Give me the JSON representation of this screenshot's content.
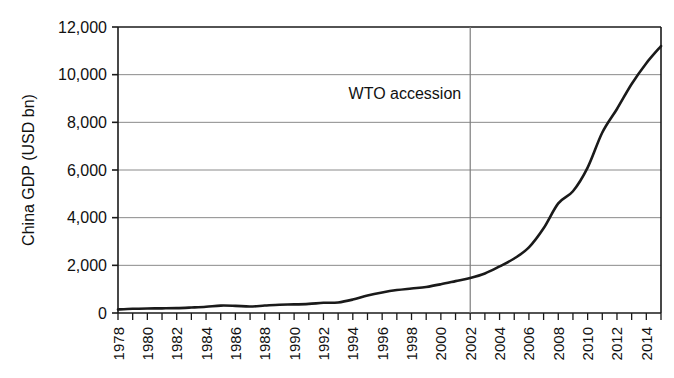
{
  "chart_data": {
    "type": "line",
    "title": "",
    "xlabel": "",
    "ylabel": "China GDP (USD bn)",
    "ylim": [
      0,
      12000
    ],
    "xlim": [
      1978,
      2015
    ],
    "ytick_labels": [
      "0",
      "2,000",
      "4,000",
      "6,000",
      "8,000",
      "10,000",
      "12,000"
    ],
    "ytick_values": [
      0,
      2000,
      4000,
      6000,
      8000,
      10000,
      12000
    ],
    "xtick_labels": [
      "1978",
      "1980",
      "1982",
      "1984",
      "1986",
      "1988",
      "1990",
      "1992",
      "1994",
      "1996",
      "1998",
      "2000",
      "2002",
      "2004",
      "2006",
      "2008",
      "2010",
      "2012",
      "2014"
    ],
    "xtick_values": [
      1978,
      1980,
      1982,
      1984,
      1986,
      1988,
      1990,
      1992,
      1994,
      1996,
      1998,
      2000,
      2002,
      2004,
      2006,
      2008,
      2010,
      2012,
      2014
    ],
    "minor_xticks_every": 1,
    "grid": "horizontal",
    "legend": "none",
    "series": [
      {
        "name": "China GDP (USD bn)",
        "x": [
          1978,
          1979,
          1980,
          1981,
          1982,
          1983,
          1984,
          1985,
          1986,
          1987,
          1988,
          1989,
          1990,
          1991,
          1992,
          1993,
          1994,
          1995,
          1996,
          1997,
          1998,
          1999,
          2000,
          2001,
          2002,
          2003,
          2004,
          2005,
          2006,
          2007,
          2008,
          2009,
          2010,
          2011,
          2012,
          2013,
          2014,
          2015
        ],
        "values": [
          150,
          178,
          191,
          196,
          205,
          230,
          260,
          310,
          300,
          273,
          312,
          348,
          360,
          383,
          427,
          444,
          564,
          734,
          863,
          962,
          1029,
          1094,
          1205,
          1337,
          1471,
          1660,
          1955,
          2286,
          2752,
          3552,
          4598,
          5110,
          6101,
          7573,
          8561,
          9607,
          10482,
          11200
        ]
      }
    ],
    "annotations": [
      {
        "name": "wto-accession",
        "label": "WTO accession",
        "x": 2002,
        "line": "vertical",
        "line_color": "#7d7d7d"
      }
    ],
    "colors": {
      "series_line": "#1a1a1a",
      "grid": "#8a8a8a",
      "axis": "#1a1a1a",
      "background": "#ffffff",
      "text": "#111111"
    }
  },
  "geometry": {
    "plot_left": 118,
    "plot_right": 661,
    "plot_top": 27,
    "plot_bottom": 313
  }
}
